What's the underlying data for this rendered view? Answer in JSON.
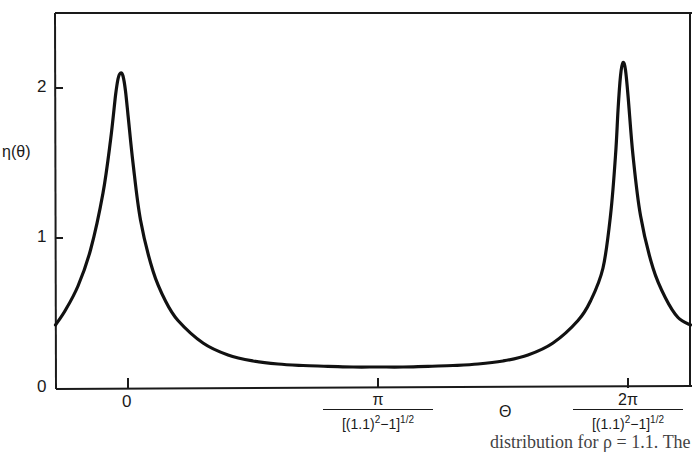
{
  "chart_data": {
    "type": "line",
    "title": "",
    "ylabel": "η(θ)",
    "xlabel": "Θ",
    "ylim": [
      0,
      2.5
    ],
    "xlim_units": [
      -0.29,
      2.25
    ],
    "x_unit_note": "x expressed in units of π/[(1.1)^2-1]^(1/2)",
    "y_ticks": [
      {
        "value": 0,
        "label": "0"
      },
      {
        "value": 1,
        "label": "1"
      },
      {
        "value": 2,
        "label": "2"
      }
    ],
    "x_ticks": [
      {
        "value": 0,
        "label_num": "0",
        "label_den": ""
      },
      {
        "value": 1,
        "label_num": "π",
        "label_den": "[(1.1)²−1]½"
      },
      {
        "value": 2,
        "label_num": "2π",
        "label_den": "[(1.1)²−1]½"
      }
    ],
    "grid": false,
    "legend": null,
    "series": [
      {
        "name": "η(θ)",
        "x": [
          -0.29,
          -0.25,
          -0.2,
          -0.15,
          -0.1,
          -0.07,
          -0.05,
          -0.04,
          -0.03,
          -0.02,
          -0.01,
          0.0,
          0.02,
          0.05,
          0.1,
          0.15,
          0.2,
          0.3,
          0.4,
          0.5,
          0.6,
          0.7,
          0.8,
          0.9,
          1.0,
          1.1,
          1.2,
          1.3,
          1.4,
          1.5,
          1.6,
          1.7,
          1.8,
          1.85,
          1.9,
          1.93,
          1.95,
          1.96,
          1.97,
          1.98,
          1.99,
          2.0,
          2.02,
          2.05,
          2.1,
          2.15,
          2.2,
          2.25
        ],
        "values": [
          0.42,
          0.52,
          0.68,
          0.92,
          1.3,
          1.65,
          1.95,
          2.06,
          2.1,
          2.08,
          1.98,
          1.82,
          1.5,
          1.12,
          0.78,
          0.58,
          0.45,
          0.3,
          0.22,
          0.18,
          0.16,
          0.15,
          0.145,
          0.14,
          0.14,
          0.14,
          0.145,
          0.15,
          0.16,
          0.18,
          0.22,
          0.3,
          0.45,
          0.58,
          0.8,
          1.15,
          1.55,
          1.85,
          2.08,
          2.17,
          2.12,
          1.95,
          1.55,
          1.15,
          0.8,
          0.6,
          0.47,
          0.42
        ]
      }
    ]
  },
  "labels": {
    "y_axis": "η(θ)",
    "x_axis": "Θ",
    "caption_fragment": "distribution for ρ = 1.1. The"
  }
}
